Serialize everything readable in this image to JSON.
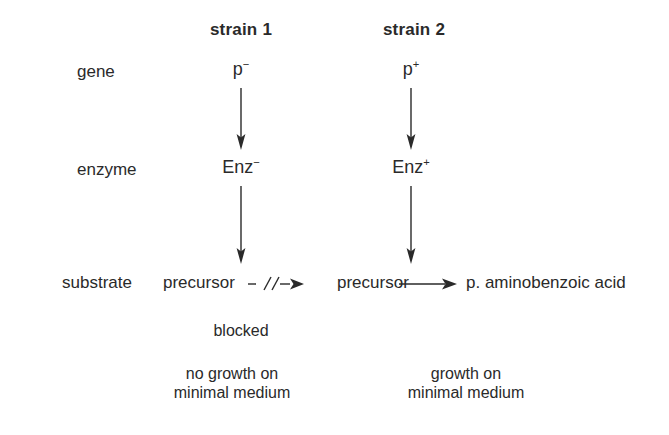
{
  "figure": {
    "type": "biology-pathway-diagram",
    "background_color": "#ffffff",
    "ink_color": "#2a2a2a"
  },
  "columns": [
    {
      "id": "strain-1",
      "title": "strain 1"
    },
    {
      "id": "strain-2",
      "title": "strain 2"
    }
  ],
  "row_labels": {
    "gene": "gene",
    "enzyme": "enzyme",
    "substrate": "substrate"
  },
  "strain1": {
    "title": "strain 1",
    "gene": {
      "symbol": "p",
      "charge": "−"
    },
    "enzyme": {
      "symbol": "Enz",
      "charge": "−"
    },
    "substrate": "precursor",
    "product": "",
    "reaction_state": "blocked",
    "blocked_label": "blocked",
    "outcome_line1": "no growth on",
    "outcome_line2": "minimal medium"
  },
  "strain2": {
    "title": "strain 2",
    "gene": {
      "symbol": "p",
      "charge": "+"
    },
    "enzyme": {
      "symbol": "Enz",
      "charge": "+"
    },
    "substrate": "precursor",
    "product": "p. aminobenzoic acid",
    "reaction_state": "proceeds",
    "outcome_line1": "growth on",
    "outcome_line2": "minimal medium"
  },
  "icons": {
    "down_arrow": "down-arrow-icon",
    "right_arrow": "right-arrow-icon",
    "blocked_arrow": "blocked-arrow-icon"
  }
}
